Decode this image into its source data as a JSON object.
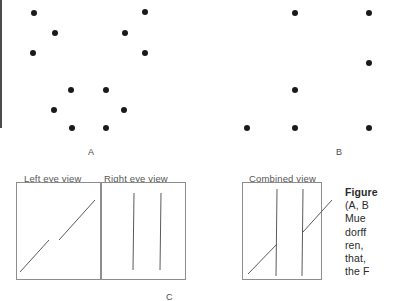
{
  "figure": {
    "type": "stereogram-illustration",
    "background_color": "#ffffff",
    "dot_color": "#1a1a1a",
    "line_color": "#5a5a5a",
    "box_border_color": "#8d8d8d",
    "label_color": "#4a4a4a"
  },
  "panels": {
    "a": {
      "label": "A",
      "label_x": 88,
      "label_y": 147,
      "dots": [
        {
          "x": 34,
          "y": 13
        },
        {
          "x": 55,
          "y": 33
        },
        {
          "x": 33,
          "y": 53
        },
        {
          "x": 145,
          "y": 12
        },
        {
          "x": 125,
          "y": 33
        },
        {
          "x": 145,
          "y": 53
        },
        {
          "x": 71,
          "y": 90
        },
        {
          "x": 106,
          "y": 90
        },
        {
          "x": 54,
          "y": 110
        },
        {
          "x": 124,
          "y": 110
        },
        {
          "x": 72,
          "y": 128
        },
        {
          "x": 106,
          "y": 128
        }
      ]
    },
    "b": {
      "label": "B",
      "label_x": 336,
      "label_y": 147,
      "dots": [
        {
          "x": 295,
          "y": 13
        },
        {
          "x": 369,
          "y": 13
        },
        {
          "x": 369,
          "y": 63
        },
        {
          "x": 295,
          "y": 90
        },
        {
          "x": 247,
          "y": 128
        },
        {
          "x": 295,
          "y": 128
        },
        {
          "x": 369,
          "y": 128
        }
      ]
    },
    "c": {
      "label": "C",
      "label_x": 166,
      "label_y": 292,
      "left_view": {
        "title": "Left eye view",
        "title_x": 24,
        "title_y": 173,
        "box": {
          "x": 16,
          "y": 182,
          "w": 85,
          "h": 98
        },
        "lines": [
          {
            "x1": 59,
            "y1": 240,
            "x2": 95,
            "y2": 200
          },
          {
            "x1": 20,
            "y1": 272,
            "x2": 49,
            "y2": 240
          }
        ]
      },
      "right_view": {
        "title": "Right eye view",
        "title_x": 104,
        "title_y": 173,
        "box": {
          "x": 101,
          "y": 182,
          "w": 85,
          "h": 98
        },
        "lines": [
          {
            "x1": 134,
            "y1": 193,
            "x2": 133,
            "y2": 270
          },
          {
            "x1": 161,
            "y1": 193,
            "x2": 160,
            "y2": 270
          }
        ]
      }
    },
    "combined": {
      "title": "Combined view",
      "title_x": 249,
      "title_y": 173,
      "box": {
        "x": 242,
        "y": 182,
        "w": 80,
        "h": 98
      },
      "lines": [
        {
          "x1": 277,
          "y1": 189,
          "x2": 276,
          "y2": 276
        },
        {
          "x1": 303,
          "y1": 189,
          "x2": 302,
          "y2": 276
        },
        {
          "x1": 248,
          "y1": 274,
          "x2": 277,
          "y2": 244
        },
        {
          "x1": 303,
          "y1": 232,
          "x2": 332,
          "y2": 200
        }
      ]
    }
  },
  "caption": {
    "x": 345,
    "y": 186,
    "lines": [
      {
        "text": "Figure",
        "bold": true
      },
      {
        "text": "(A, B",
        "bold": false
      },
      {
        "text": "Mue",
        "bold": false
      },
      {
        "text": "dorff",
        "bold": false
      },
      {
        "text": "ren,",
        "bold": false
      },
      {
        "text": "that,",
        "bold": false
      },
      {
        "text": "the F",
        "bold": false
      }
    ]
  }
}
